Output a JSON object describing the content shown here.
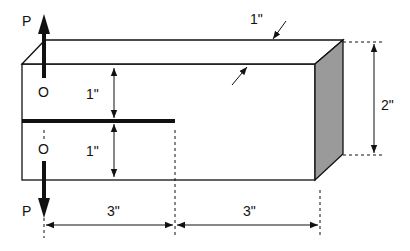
{
  "diagram": {
    "type": "engineering-dimension-drawing",
    "labels": {
      "load_top": "P",
      "load_bottom": "P",
      "point_top": "O",
      "point_bottom": "O",
      "thickness": "1\"",
      "upper_arm_height": "1\"",
      "lower_arm_height": "1\"",
      "total_height": "2\"",
      "crack_length": "3\"",
      "ligament_length": "3\""
    },
    "colors": {
      "line": "#111111",
      "side_face": "#9a9a9a",
      "background": "#ffffff"
    }
  }
}
